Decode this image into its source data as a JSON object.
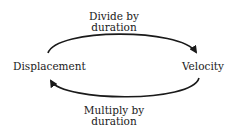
{
  "nodes": {
    "left": "Displacement",
    "right": "Velocity"
  },
  "edges": {
    "top": {
      "line1": "Divide by",
      "line2": "duration",
      "from": "Displacement",
      "to": "Velocity"
    },
    "bottom": {
      "line1": "Multiply by",
      "line2": "duration",
      "from": "Velocity",
      "to": "Displacement"
    }
  },
  "colors": {
    "stroke": "#1a1a1a",
    "background": "#ffffff"
  }
}
